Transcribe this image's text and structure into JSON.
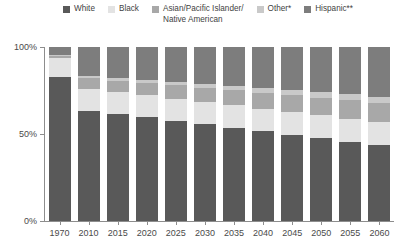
{
  "chart_data": {
    "type": "bar",
    "stacked": true,
    "stacked_percent": true,
    "title": "",
    "subtitle": "",
    "xlabel": "",
    "ylabel": "",
    "ylim": [
      0,
      100
    ],
    "yticks": [
      0,
      50,
      100
    ],
    "ytick_labels": [
      "0%",
      "50%",
      "100%"
    ],
    "grid": false,
    "legend_position": "top",
    "categories": [
      "1970",
      "2010",
      "2015",
      "2020",
      "2025",
      "2030",
      "2035",
      "2040",
      "2045",
      "2050",
      "2055",
      "2060"
    ],
    "series": [
      {
        "name": "White",
        "color": "#595959",
        "values": [
          83.0,
          63.5,
          61.5,
          59.5,
          57.5,
          55.5,
          53.5,
          51.5,
          49.5,
          47.5,
          45.5,
          43.5
        ]
      },
      {
        "name": "Black",
        "color": "#e3e3e3",
        "values": [
          10.5,
          12.5,
          12.6,
          12.7,
          12.8,
          12.9,
          13.0,
          13.1,
          13.2,
          13.3,
          13.4,
          13.5
        ]
      },
      {
        "name": "Asian/Pacific Islander/\nNative American",
        "color": "#a8a8a8",
        "values": [
          1.5,
          6.0,
          6.5,
          7.0,
          7.6,
          8.1,
          8.6,
          9.1,
          9.6,
          10.1,
          10.6,
          11.0
        ]
      },
      {
        "name": "Other*",
        "color": "#c9c9c9",
        "values": [
          0.5,
          1.5,
          1.7,
          1.9,
          2.1,
          2.3,
          2.5,
          2.7,
          2.9,
          3.1,
          3.3,
          3.5
        ]
      },
      {
        "name": "Hispanic**",
        "color": "#7d7d7d",
        "values": [
          4.5,
          16.5,
          17.7,
          18.9,
          20.0,
          21.2,
          22.4,
          23.6,
          24.8,
          26.0,
          27.2,
          28.5
        ]
      }
    ]
  }
}
